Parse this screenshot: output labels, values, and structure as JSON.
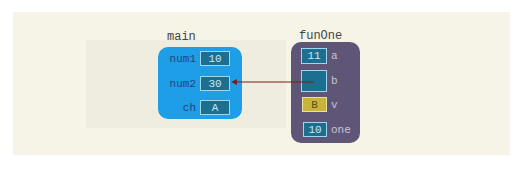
{
  "frames": {
    "main": {
      "label": "main",
      "color": "#1e9ee6",
      "variables": [
        {
          "name": "num1",
          "value": "10"
        },
        {
          "name": "num2",
          "value": "30"
        },
        {
          "name": "ch",
          "value": "A"
        }
      ]
    },
    "funOne": {
      "label": "funOne",
      "color": "#5f5577",
      "variables": [
        {
          "name": "a",
          "value": "11"
        },
        {
          "name": "b",
          "value": ""
        },
        {
          "name": "v",
          "value": "B"
        },
        {
          "name": "one",
          "value": "10"
        }
      ]
    }
  },
  "arrow": {
    "from": "funOne.b",
    "to": "main.num2",
    "color": "#7a1f1f"
  }
}
